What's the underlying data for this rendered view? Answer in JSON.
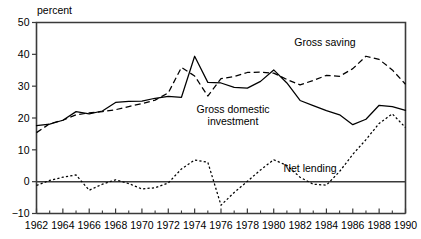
{
  "chart_data": {
    "type": "line",
    "title": "",
    "subtitle": "",
    "xlabel": "",
    "ylabel": "percent",
    "ylabel_position": "top-left",
    "grid": false,
    "legend": "inline-annotations",
    "xlim": [
      1962,
      1990
    ],
    "ylim": [
      -10,
      50
    ],
    "x_ticks_major": [
      1962,
      1964,
      1966,
      1968,
      1970,
      1972,
      1974,
      1976,
      1978,
      1980,
      1982,
      1984,
      1986,
      1988,
      1990
    ],
    "x_ticks_minor": [
      1963,
      1965,
      1967,
      1969,
      1971,
      1973,
      1975,
      1977,
      1979,
      1981,
      1983,
      1985,
      1987,
      1989
    ],
    "y_ticks": [
      -10,
      0,
      10,
      20,
      30,
      40,
      50
    ],
    "x_tick_labels": [
      "1962",
      "1964",
      "1966",
      "1968",
      "1970",
      "1972",
      "1974",
      "1976",
      "1978",
      "1980",
      "1982",
      "1984",
      "1986",
      "1988",
      "1990"
    ],
    "y_tick_labels": [
      "-10",
      "0",
      "10",
      "20",
      "30",
      "40",
      "50"
    ],
    "zero_line": 0,
    "x": [
      1962,
      1963,
      1964,
      1965,
      1966,
      1967,
      1968,
      1969,
      1970,
      1971,
      1972,
      1973,
      1974,
      1975,
      1976,
      1977,
      1978,
      1979,
      1980,
      1981,
      1982,
      1983,
      1984,
      1985,
      1986,
      1987,
      1988,
      1989,
      1990
    ],
    "series": [
      {
        "name": "Gross saving",
        "style": "dashed",
        "color": "#000000",
        "values": [
          15.4,
          18.2,
          19.3,
          21.0,
          21.6,
          22.0,
          22.6,
          23.6,
          24.5,
          25.6,
          27.9,
          35.9,
          33.2,
          26.9,
          32.4,
          33.0,
          34.3,
          34.4,
          34.1,
          32.1,
          30.4,
          31.8,
          33.4,
          33.1,
          35.5,
          39.4,
          38.4,
          35.1,
          30.6
        ]
      },
      {
        "name": "Gross domestic investment",
        "style": "solid",
        "color": "#000000",
        "values": [
          17.6,
          18.1,
          19.3,
          22.0,
          21.3,
          22.2,
          24.9,
          25.2,
          25.3,
          26.2,
          26.8,
          26.5,
          39.4,
          31.2,
          31.0,
          29.6,
          29.4,
          31.5,
          35.1,
          31.0,
          25.5,
          23.9,
          22.3,
          21.0,
          17.9,
          19.6,
          24.0,
          23.6,
          22.4
        ]
      },
      {
        "name": "Net lending",
        "style": "dotted",
        "color": "#000000",
        "values": [
          -1.2,
          0.4,
          1.4,
          2.1,
          -2.7,
          -0.8,
          0.6,
          -0.6,
          -2.3,
          -1.9,
          -0.4,
          4.0,
          6.8,
          6.1,
          -7.4,
          -3.4,
          0.1,
          3.7,
          6.9,
          5.1,
          1.4,
          -0.8,
          -1.1,
          3.2,
          8.6,
          13.2,
          18.3,
          21.3,
          17.0
        ]
      }
    ],
    "annotations": [
      {
        "name": "gross-saving-label",
        "text": "Gross saving",
        "x_px": 325,
        "y_px": 46
      },
      {
        "name": "gross-domestic-investment-label",
        "text": "Gross domestic\ninvestment",
        "text_line1": "Gross domestic",
        "text_line2": "investment",
        "x_px": 233,
        "y_px": 113
      },
      {
        "name": "net-lending-label",
        "text": "Net lending",
        "x_px": 310,
        "y_px": 172
      }
    ]
  },
  "axis": {
    "y_unit_label": "percent"
  }
}
